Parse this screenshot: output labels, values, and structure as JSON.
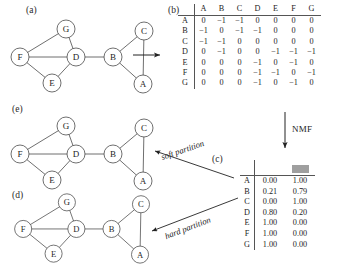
{
  "figure": {
    "panels": {
      "a": "(a)",
      "b": "(b)",
      "c": "(c)",
      "d": "(d)",
      "e": "(e)"
    },
    "arrow_labels": {
      "nmf": "NMF",
      "soft": "soft partition",
      "hard": "hard partition"
    }
  },
  "graph": {
    "nodes": [
      {
        "id": "G",
        "label": "G",
        "x": 60,
        "y": 13
      },
      {
        "id": "F",
        "label": "F",
        "x": 14,
        "y": 41
      },
      {
        "id": "D",
        "label": "D",
        "x": 70,
        "y": 41
      },
      {
        "id": "E",
        "label": "E",
        "x": 46,
        "y": 67
      },
      {
        "id": "B",
        "label": "B",
        "x": 107,
        "y": 41
      },
      {
        "id": "C",
        "label": "C",
        "x": 138,
        "y": 15
      },
      {
        "id": "A",
        "label": "A",
        "x": 137,
        "y": 68
      }
    ],
    "edges": [
      [
        "F",
        "G"
      ],
      [
        "G",
        "D"
      ],
      [
        "F",
        "D"
      ],
      [
        "F",
        "E"
      ],
      [
        "E",
        "D"
      ],
      [
        "D",
        "B"
      ],
      [
        "B",
        "C"
      ],
      [
        "B",
        "A"
      ],
      [
        "C",
        "A"
      ]
    ]
  },
  "matrix": {
    "caption": "(b)",
    "columns": [
      "A",
      "B",
      "C",
      "D",
      "E",
      "F",
      "G"
    ],
    "rows": [
      "A",
      "B",
      "C",
      "D",
      "E",
      "F",
      "G"
    ],
    "values": [
      [
        "0",
        "−1",
        "−1",
        "0",
        "0",
        "0",
        "0"
      ],
      [
        "−1",
        "0",
        "−1",
        "−1",
        "0",
        "0",
        "0"
      ],
      [
        "−1",
        "−1",
        "0",
        "0",
        "0",
        "0",
        "0"
      ],
      [
        "0",
        "−1",
        "0",
        "0",
        "−1",
        "−1",
        "−1"
      ],
      [
        "0",
        "0",
        "0",
        "−1",
        "0",
        "−1",
        "0"
      ],
      [
        "0",
        "0",
        "0",
        "−1",
        "−1",
        "0",
        "−1"
      ],
      [
        "0",
        "0",
        "0",
        "−1",
        "0",
        "−1",
        "0"
      ]
    ]
  },
  "nmf_table": {
    "caption": "(c)",
    "col_swatches": [
      "blank",
      "gray"
    ],
    "swatch_color": "#9f9f9f",
    "rows": [
      "A",
      "B",
      "C",
      "D",
      "E",
      "F",
      "G"
    ],
    "values": [
      [
        "0.00",
        "1.00"
      ],
      [
        "0.21",
        "0.79"
      ],
      [
        "0.00",
        "1.00"
      ],
      [
        "0.80",
        "0.20"
      ],
      [
        "1.00",
        "0.00"
      ],
      [
        "1.00",
        "0.00"
      ],
      [
        "1.00",
        "0.00"
      ]
    ]
  }
}
